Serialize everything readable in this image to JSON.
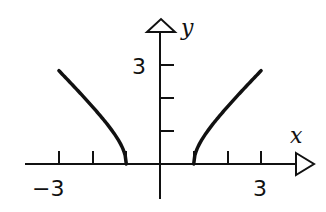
{
  "chart_data": {
    "type": "line",
    "title": "",
    "xlabel": "x",
    "ylabel": "y",
    "xlim": [
      -4.5,
      4.5
    ],
    "ylim": [
      -1.3,
      4.3
    ],
    "x_tick_labels": [
      "-3",
      "3"
    ],
    "y_tick_labels": [
      "3"
    ],
    "x_ticks": [
      -3,
      -2,
      -1,
      1,
      2,
      3
    ],
    "y_ticks": [
      1,
      2,
      3
    ],
    "grid": false,
    "legend": null,
    "series": [
      {
        "name": "left branch",
        "x": [
          -3,
          -2.5,
          -2,
          -1.5,
          -1.2,
          -1
        ],
        "y": [
          2.83,
          2.29,
          1.73,
          1.12,
          0.66,
          0
        ]
      },
      {
        "name": "right branch",
        "x": [
          1,
          1.2,
          1.5,
          2,
          2.5,
          3
        ],
        "y": [
          0,
          0.66,
          1.12,
          1.73,
          2.29,
          2.83
        ]
      }
    ]
  },
  "labels": {
    "x_axis": "x",
    "y_axis": "y",
    "x_neg": "−3",
    "x_pos": "3",
    "y_pos": "3"
  }
}
